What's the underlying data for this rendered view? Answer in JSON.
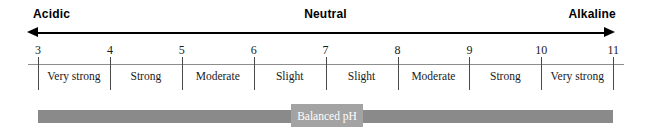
{
  "header": {
    "acidic_label": "Acidic",
    "neutral_label": "Neutral",
    "alkaline_label": "Alkaline"
  },
  "bottom_bar": {
    "balanced_label": "Balanced pH",
    "bar_color": "#8a8a8a",
    "box_color": "#a3a3a3"
  },
  "chart_data": {
    "type": "table",
    "xlabel": "pH",
    "ylabel": "",
    "xlim": [
      3,
      11
    ],
    "grid": false,
    "legend": "none",
    "axis_direction": "double-arrow",
    "tick_labels": [
      "3",
      "4",
      "5",
      "6",
      "7",
      "8",
      "9",
      "10",
      "11"
    ],
    "tick_values": [
      3,
      4,
      5,
      6,
      7,
      8,
      9,
      10,
      11
    ],
    "categories": [
      "3-4",
      "4-5",
      "5-6",
      "6-7",
      "7-8",
      "8-9",
      "9-10",
      "10-11"
    ],
    "band_labels": [
      "Very strong",
      "Strong",
      "Moderate",
      "Slight",
      "Slight",
      "Moderate",
      "Strong",
      "Very strong"
    ],
    "annotations": [
      {
        "text": "Acidic",
        "position": "top-left"
      },
      {
        "text": "Neutral",
        "position": "top-center"
      },
      {
        "text": "Alkaline",
        "position": "top-right"
      },
      {
        "text": "Balanced pH",
        "position": "bottom-center"
      }
    ]
  }
}
